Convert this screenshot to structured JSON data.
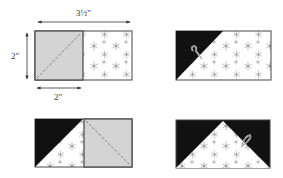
{
  "colors": {
    "background_print": "#ffffff",
    "snowflake": "#9a9a9a",
    "gray_square": "#d4d4d4",
    "dark_fabric": "#111111",
    "outline": "#444444",
    "dashed_line": "#777777",
    "dimension": "#333333"
  },
  "dimensions": {
    "width_label": "3½\"",
    "height_label": "2\"",
    "square_label": "2\""
  },
  "steps": [
    {
      "id": "step-1",
      "description": "2\" gray square placed on left of 3½\" x 2\" print rectangle, dashed diagonal bottom-left to top-right"
    },
    {
      "id": "step-2",
      "description": "Left corner sewn and pressed to dark triangle; needle icon"
    },
    {
      "id": "step-3",
      "description": "Second gray square on right with dashed diagonal top-left to bottom-right"
    },
    {
      "id": "step-4",
      "description": "Finished flying geese unit with needle icon"
    }
  ]
}
